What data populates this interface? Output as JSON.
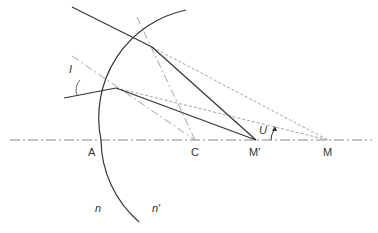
{
  "diagram": {
    "labels": {
      "A": "A",
      "C": "C",
      "M_prime": "M′",
      "M": "M",
      "n": "n",
      "n_prime": "n′",
      "I": "I",
      "U": "U"
    },
    "colors": {
      "ray": "#333333",
      "surface": "#333333",
      "construction": "#999999",
      "axis": "#888888"
    },
    "points": {
      "A": [
        101,
        140
      ],
      "C": [
        195,
        140
      ],
      "M_prime": [
        256,
        140
      ],
      "M": [
        328,
        140
      ],
      "P1": [
        152,
        47
      ],
      "P2": [
        116,
        88
      ]
    }
  }
}
